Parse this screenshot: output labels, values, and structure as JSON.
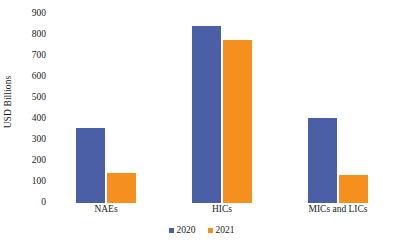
{
  "chart_data": {
    "type": "bar",
    "title": "",
    "subtitle": "",
    "xlabel": "",
    "ylabel": "USD Billions",
    "categories": [
      "NAEs",
      "HICs",
      "MICs and LICs"
    ],
    "series": [
      {
        "name": "2020",
        "color": "#4a5fa5",
        "values": [
          355,
          845,
          405
        ]
      },
      {
        "name": "2021",
        "color": "#f5901e",
        "values": [
          145,
          775,
          133
        ]
      }
    ],
    "ylim": [
      0,
      900
    ],
    "ytick_step": 100,
    "ytick_labels": [
      "900",
      "800",
      "700",
      "600",
      "500",
      "400",
      "300",
      "200",
      "100",
      "0"
    ],
    "grid": false,
    "legend_position": "bottom-center",
    "annotations": []
  },
  "legend": {
    "items": [
      {
        "label": "2020",
        "swatch": "legend-swatch-2020"
      },
      {
        "label": "2021",
        "swatch": "legend-swatch-2021"
      }
    ]
  }
}
